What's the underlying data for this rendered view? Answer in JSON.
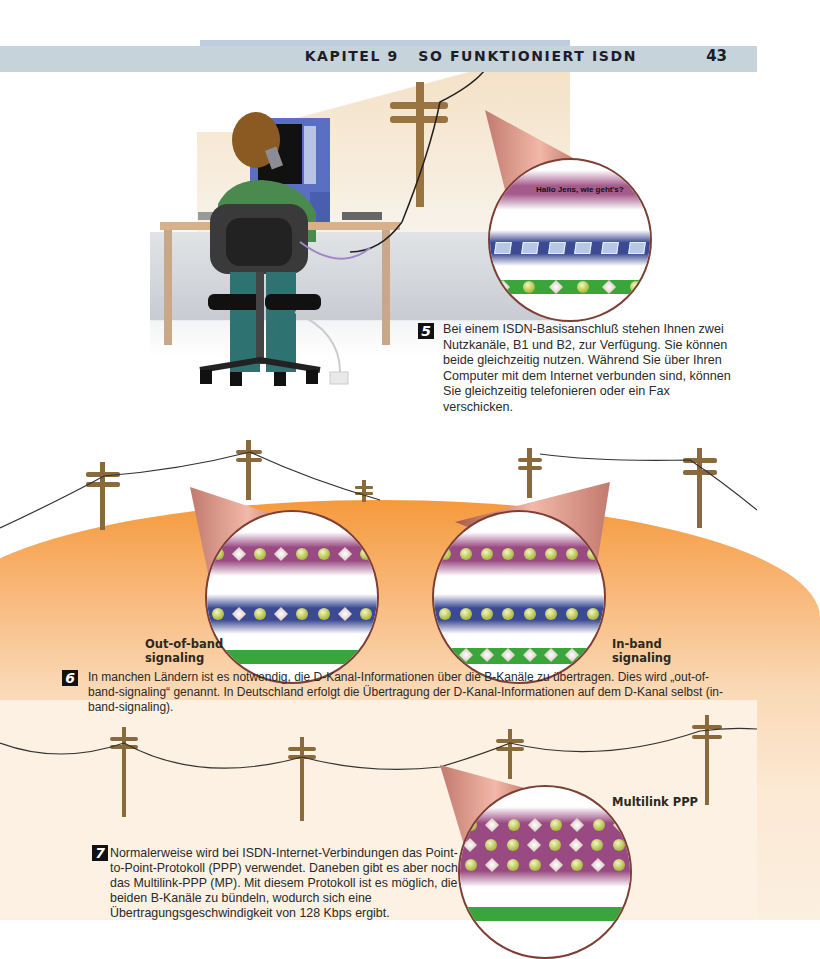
{
  "header": {
    "chapter": "KAPITEL 9   SO FUNKTIONIERT ISDN",
    "page_number": "43"
  },
  "section5": {
    "badge": "5",
    "text": "Bei einem ISDN-Basisanschluß stehen Ihnen zwei Nutzkanäle, B1 und B2, zur Verfügung. Sie können beide gleichzeitig nutzen. Während Sie über Ihren Computer mit dem Internet verbunden sind, können Sie gleichzeitig telefonieren oder ein Fax verschicken.",
    "lens_caption": "Hallo Jens, wie geht's?"
  },
  "section6": {
    "badge": "6",
    "text": "In manchen Ländern ist es notwendig, die D-Kanal-Informationen über die B-Kanäle zu übertragen. Dies wird „out-of-band-signaling“ genannt. In Deutschland erfolgt die Übertragung der D-Kanal-Informationen auf dem D-Kanal selbst (in-band-signaling).",
    "label_left_line1": "Out-of-band",
    "label_left_line2": "signaling",
    "label_right_line1": "In-band",
    "label_right_line2": "signaling"
  },
  "section7": {
    "badge": "7",
    "text": "Normalerweise wird bei ISDN-Internet-Verbindungen das Point-to-Point-Protokoll (PPP) verwendet. Daneben gibt es aber noch das Multilink-PPP (MP). Mit diesem Protokoll ist es möglich, die beiden B-Kanäle zu bündeln, wodurch sich eine Übertragungsgeschwindigkeit von 128 Kbps ergibt.",
    "label": "Multilink PPP"
  },
  "colors": {
    "header_band": "#c7d3db",
    "magenta_band": "#9a4a82",
    "blue_band": "#3c4a94",
    "green_band": "#3aa53a",
    "orange": "#f59a3c",
    "pole": "#8a6a3a"
  }
}
